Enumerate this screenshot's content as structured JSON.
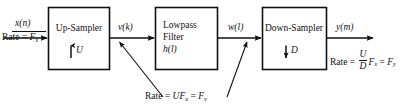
{
  "figure": {
    "type": "block-diagram",
    "background_color": "#ffffff",
    "line_color": "#111111"
  },
  "blocks": [
    {
      "id": "up-sampler",
      "title": "Up-Sampler",
      "factor_arrow": "↑",
      "factor": "U"
    },
    {
      "id": "lowpass-filter",
      "title_line1": "Lowpass",
      "title_line2": "Filter",
      "title_line3": "h(l)"
    },
    {
      "id": "down-sampler",
      "title": "Down-Sampler",
      "factor_arrow": "↓",
      "factor": "D"
    }
  ],
  "signals": {
    "input": "x(n)",
    "after_upsampler": "v(k)",
    "after_filter": "w(l)",
    "output": "y(m)"
  },
  "rates": {
    "input": {
      "prefix": "Rate = ",
      "symbol": "F",
      "subscript": "x"
    },
    "intermediate": {
      "prefix": "Rate = ",
      "expr1_main": "UF",
      "expr1_sub": "x",
      "equals": " = ",
      "expr2_main": "F",
      "expr2_sub": "v"
    },
    "output": {
      "prefix": "Rate = ",
      "numerator": "U",
      "denominator": "D",
      "term_main": "F",
      "term_sub": "x",
      "equals": " = ",
      "result_main": "F",
      "result_sub": "y"
    }
  }
}
